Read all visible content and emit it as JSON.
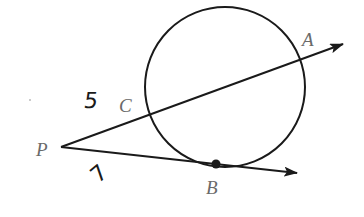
{
  "diagram": {
    "type": "geometry-secant-tangent",
    "colors": {
      "stroke": "#1a1a1a",
      "label": "#6a6a6a",
      "background": "#ffffff"
    },
    "circle": {
      "cx": 225,
      "cy": 87,
      "r": 80
    },
    "points": {
      "P": {
        "label": "P",
        "x": 61,
        "y": 147
      },
      "C": {
        "label": "C",
        "x": 150,
        "y": 113
      },
      "A": {
        "label": "A",
        "x": 301,
        "y": 59
      },
      "B": {
        "label": "B",
        "x": 216,
        "y": 164
      }
    },
    "rays": [
      {
        "name": "secant-PCA",
        "from": "P",
        "through": [
          "C",
          "A"
        ],
        "tip": [
          343,
          44
        ]
      },
      {
        "name": "tangent-PB",
        "from": "P",
        "through": [
          "B"
        ],
        "tip": [
          297,
          173
        ]
      }
    ],
    "segment_labels": {
      "PC": "5",
      "PB": "7"
    }
  }
}
